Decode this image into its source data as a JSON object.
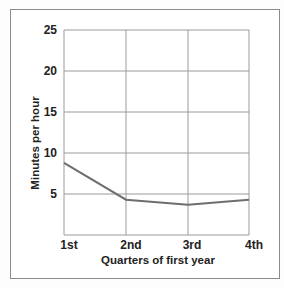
{
  "chart_data": {
    "type": "line",
    "title": "",
    "xlabel": "Quarters of first year",
    "ylabel": "Minutes per hour",
    "categories": [
      "1st",
      "2nd",
      "3rd",
      "4th"
    ],
    "series": [
      {
        "name": "Minutes per hour",
        "values": [
          8.8,
          4.3,
          3.7,
          4.3
        ]
      }
    ],
    "yticks": [
      5,
      10,
      15,
      20,
      25
    ],
    "ylim": [
      0,
      25
    ],
    "grid": true,
    "legend": "none",
    "colors": {
      "line": "#6e6e6e",
      "grid": "#9a9a9a",
      "frame": "#8a8a8a"
    }
  },
  "labels": {
    "x_title": "Quarters of first year",
    "y_title": "Minutes per hour",
    "x_ticks": [
      "1st",
      "2nd",
      "3rd",
      "4th"
    ],
    "y_ticks": [
      "25",
      "20",
      "15",
      "10",
      "5"
    ]
  }
}
